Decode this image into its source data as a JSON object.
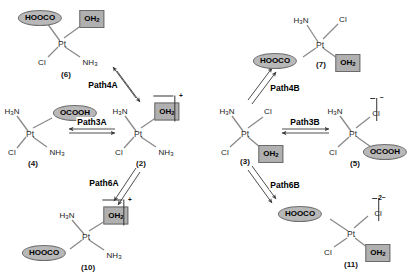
{
  "diagram": {
    "ligand_fill_ellipse": "#b8b8b8",
    "ligand_fill_box": "#b0b0b0"
  },
  "structures": [
    {
      "id": "s6",
      "label": "(6)",
      "center_text": "Pt",
      "ligands": {
        "top_left": {
          "text": "HOOCO",
          "style": "ellipse"
        },
        "top_right": {
          "text": "OH",
          "sub": "2",
          "style": "box"
        },
        "bottom_left": {
          "text": "Cl",
          "style": "plain"
        },
        "bottom_right": {
          "text": "NH",
          "sub": "3",
          "style": "plain"
        }
      },
      "charge": ""
    },
    {
      "id": "s4",
      "label": "(4)",
      "center_text": "Pt",
      "ligands": {
        "top_left": {
          "text": "H",
          "sub": "3",
          "text2": "N",
          "style": "plain"
        },
        "top_right": {
          "text": "OCOOH",
          "style": "ellipse"
        },
        "bottom_left": {
          "text": "Cl",
          "style": "plain"
        },
        "bottom_right": {
          "text": "NH",
          "sub": "3",
          "style": "plain"
        }
      },
      "charge": ""
    },
    {
      "id": "s2",
      "label": "(2)",
      "center_text": "Pt",
      "ligands": {
        "top_left": {
          "text": "H",
          "sub": "3",
          "text2": "N",
          "style": "plain"
        },
        "top_right": {
          "text": "OH",
          "sub": "2",
          "style": "box",
          "charge": "+"
        },
        "bottom_left": {
          "text": "Cl",
          "style": "plain"
        },
        "bottom_right": {
          "text": "NH",
          "sub": "3",
          "style": "plain"
        }
      },
      "charge": "+"
    },
    {
      "id": "s10",
      "label": "(10)",
      "center_text": "Pt",
      "ligands": {
        "top_left": {
          "text": "H",
          "sub": "3",
          "text2": "N",
          "style": "plain"
        },
        "top_right": {
          "text": "OH",
          "sub": "2",
          "style": "box",
          "charge": "+"
        },
        "bottom_left": {
          "text": "HOOCO",
          "style": "ellipse"
        },
        "bottom_right": {
          "text": "NH",
          "sub": "3",
          "style": "plain"
        }
      },
      "charge": "+"
    },
    {
      "id": "s7",
      "label": "(7)",
      "center_text": "Pt",
      "ligands": {
        "top_left": {
          "text": "H",
          "sub": "3",
          "text2": "N",
          "style": "plain"
        },
        "top_right": {
          "text": "Cl",
          "style": "plain"
        },
        "bottom_left": {
          "text": "HOOCO",
          "style": "ellipse"
        },
        "bottom_right": {
          "text": "OH",
          "sub": "2",
          "style": "box"
        }
      },
      "charge": ""
    },
    {
      "id": "s3",
      "label": "(3)",
      "center_text": "Pt",
      "ligands": {
        "top_left": {
          "text": "H",
          "sub": "3",
          "text2": "N",
          "style": "plain"
        },
        "top_right": {
          "text": "Cl",
          "style": "plain"
        },
        "bottom_left": {
          "text": "Cl",
          "style": "plain"
        },
        "bottom_right": {
          "text": "OH",
          "sub": "2",
          "style": "box"
        }
      },
      "charge": ""
    },
    {
      "id": "s5",
      "label": "(5)",
      "center_text": "Pt",
      "ligands": {
        "top_left": {
          "text": "H",
          "sub": "3",
          "text2": "N",
          "style": "plain"
        },
        "top_right": {
          "text": "Cl",
          "style": "plain",
          "charge": "−"
        },
        "bottom_left": {
          "text": "Cl",
          "style": "plain"
        },
        "bottom_right": {
          "text": "OCOOH",
          "style": "ellipse"
        }
      },
      "charge": "−"
    },
    {
      "id": "s11",
      "label": "(11)",
      "center_text": "Pt",
      "ligands": {
        "top_left": {
          "text": "HOOCO",
          "style": "ellipse"
        },
        "top_right": {
          "text": "Cl",
          "style": "plain",
          "charge": "2−"
        },
        "bottom_left": {
          "text": "Cl",
          "style": "plain"
        },
        "bottom_right": {
          "text": "OH",
          "sub": "2",
          "style": "box"
        }
      },
      "charge": "2−"
    }
  ],
  "paths": [
    {
      "id": "path4a",
      "label": "Path4A",
      "orientation": "diagonal-up-left",
      "connects": [
        "(2)",
        "(6)"
      ]
    },
    {
      "id": "path3a",
      "label": "Path3A",
      "orientation": "horizontal",
      "connects": [
        "(2)",
        "(4)"
      ]
    },
    {
      "id": "path6a",
      "label": "Path6A",
      "orientation": "diagonal-down-left",
      "connects": [
        "(2)",
        "(10)"
      ]
    },
    {
      "id": "path4b",
      "label": "Path4B",
      "orientation": "diagonal-up-right",
      "connects": [
        "(3)",
        "(7)"
      ]
    },
    {
      "id": "path3b",
      "label": "Path3B",
      "orientation": "horizontal",
      "connects": [
        "(3)",
        "(5)"
      ]
    },
    {
      "id": "path6b",
      "label": "Path6B",
      "orientation": "diagonal-down-right",
      "connects": [
        "(3)",
        "(11)"
      ]
    }
  ],
  "labels": {
    "s6_id": "(6)",
    "s4_id": "(4)",
    "s2_id": "(2)",
    "s10_id": "(10)",
    "s7_id": "(7)",
    "s3_id": "(3)",
    "s5_id": "(5)",
    "s11_id": "(11)",
    "pt": "Pt",
    "hoocо": "HOOCO"
  }
}
